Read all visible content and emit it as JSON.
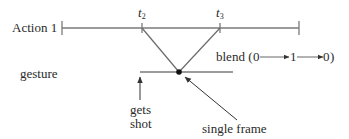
{
  "diagram": {
    "track_label": "Action 1",
    "gesture_label": "gesture",
    "markers": [
      {
        "var": "t",
        "sub": "2"
      },
      {
        "var": "t",
        "sub": "3"
      }
    ],
    "blend": {
      "prefix": "blend (",
      "v0": "0",
      "v1": "1",
      "v2": "0",
      "suffix": ")"
    },
    "annotations": {
      "gets_shot_line1": "gets",
      "gets_shot_line2": "shot",
      "single_frame": "single frame"
    },
    "colors": {
      "line": "#7a7a7a",
      "text": "#2a2a2a",
      "dot": "#111111"
    }
  }
}
